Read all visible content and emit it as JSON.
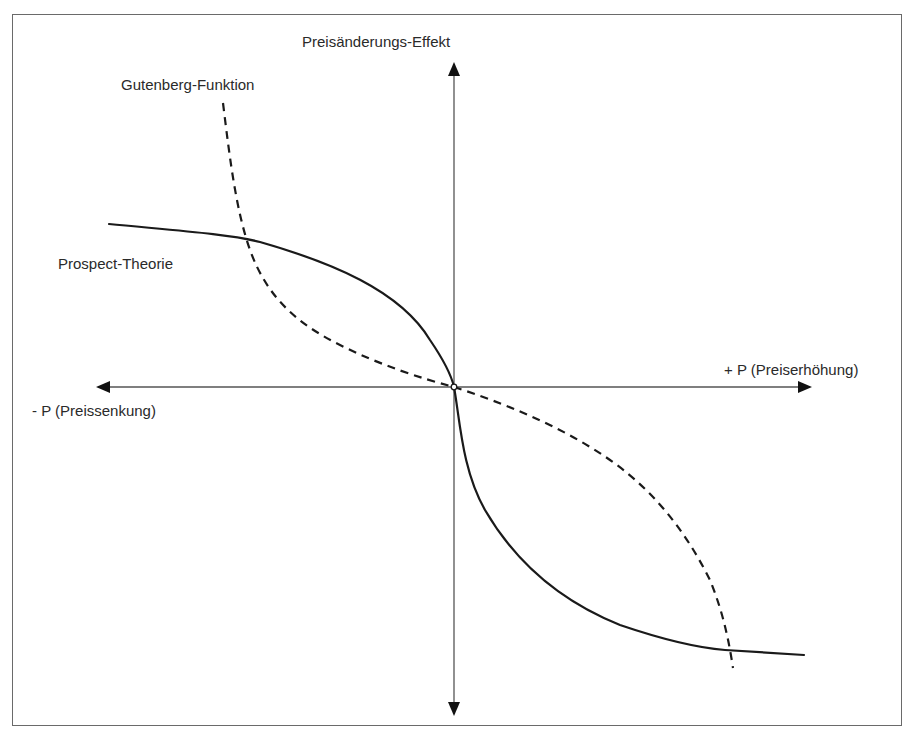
{
  "diagram": {
    "title": "Preisänderungs-Effekt",
    "axes": {
      "y_label": "Preisänderungs-Effekt",
      "x_positive_label": "+ P (Preiserhöhung)",
      "x_negative_label": "- P (Preissenkung)"
    },
    "curves": [
      {
        "name": "Gutenberg-Funktion",
        "style": "dashed",
        "color": "#1a1a1a"
      },
      {
        "name": "Prospect-Theorie",
        "style": "solid",
        "color": "#1a1a1a"
      }
    ],
    "origin_marker": "open-circle",
    "colors": {
      "line": "#1a1a1a",
      "axis": "#555555",
      "frame": "#6a6a6a",
      "background": "#ffffff"
    }
  }
}
